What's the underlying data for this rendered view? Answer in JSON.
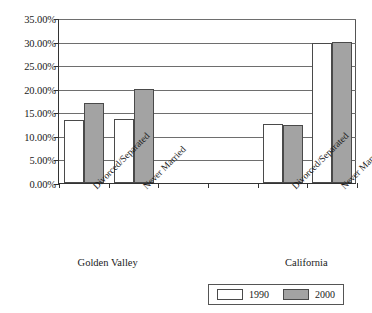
{
  "chart_data": {
    "type": "bar",
    "title": "",
    "xlabel": "",
    "ylabel": "",
    "ylim": [
      0,
      35
    ],
    "grid": true,
    "legend_position": "bottom-right",
    "categories": [
      "Divorced/Separated",
      "Never Married",
      "",
      "",
      "Divorced/Separated",
      "Never Married"
    ],
    "groups": [
      "Golden Valley",
      "California"
    ],
    "y_tick_labels": [
      "0.00%",
      "5.00%",
      "10.00%",
      "15.00%",
      "20.00%",
      "25.00%",
      "30.00%",
      "35.00%"
    ],
    "y_tick_values": [
      0,
      5,
      10,
      15,
      20,
      25,
      30,
      35
    ],
    "series": [
      {
        "name": "1990",
        "color": "#ffffff",
        "values": [
          13.3,
          13.5,
          null,
          null,
          12.6,
          29.7
        ]
      },
      {
        "name": "2000",
        "color": "#a3a3a3",
        "values": [
          17.0,
          20.0,
          null,
          null,
          12.4,
          30.0
        ]
      }
    ]
  },
  "legend": {
    "entries": [
      {
        "label": "1990"
      },
      {
        "label": "2000"
      }
    ]
  },
  "group_labels": [
    {
      "label": "Golden Valley"
    },
    {
      "label": "California"
    }
  ],
  "colors": {
    "series_1990": "#ffffff",
    "series_2000": "#a3a3a3",
    "axis": "#333333",
    "gridline": "#6e6e6e",
    "text": "#1a1a1a"
  }
}
